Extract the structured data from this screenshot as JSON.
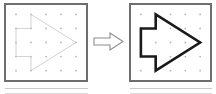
{
  "figure": {
    "kind": "geometry-dot-grid-shape-pair",
    "colors": {
      "panel_border": "#6e6e6e",
      "grid_dot": "#b7b7b7",
      "shape_faded": "#c6c6c6",
      "shape_solid": "#1a1a1a",
      "connector_stroke": "#8c8c8c",
      "background": "#ffffff",
      "stub_line": "#c9c9c9"
    },
    "grid": {
      "columns": 5,
      "rows": 5,
      "dot_radius": 0.9
    },
    "shape": {
      "name": "arrow-pentagon-polygon",
      "points": [
        [
          1,
          0
        ],
        [
          4,
          2
        ],
        [
          1,
          4
        ],
        [
          1,
          3
        ],
        [
          0,
          3
        ],
        [
          0,
          1
        ],
        [
          1,
          1
        ]
      ]
    },
    "panels": [
      {
        "id": "before",
        "name": "left-panel",
        "shape_style": "faded-thin",
        "stroke_width": 0.8
      },
      {
        "id": "after",
        "name": "right-panel",
        "shape_style": "solid-thick",
        "stroke_width": 2.6
      }
    ],
    "connector": {
      "name": "right-arrow-connector",
      "direction": "right",
      "style": "outlined"
    },
    "below_panels": [
      {
        "id": "next-left",
        "name": "partial-panel-below-left"
      },
      {
        "id": "next-right",
        "name": "partial-panel-below-right"
      }
    ]
  }
}
